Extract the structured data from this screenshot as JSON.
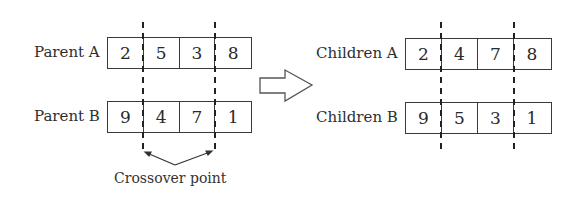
{
  "diagram": {
    "parents": [
      {
        "label": "Parent A",
        "genes": [
          "2",
          "5",
          "3",
          "8"
        ]
      },
      {
        "label": "Parent B",
        "genes": [
          "9",
          "4",
          "7",
          "1"
        ]
      }
    ],
    "children": [
      {
        "label": "Children A",
        "genes": [
          "2",
          "4",
          "7",
          "8"
        ]
      },
      {
        "label": "Children B",
        "genes": [
          "9",
          "5",
          "3",
          "1"
        ]
      }
    ],
    "crossover_label": "Crossover point",
    "arrow": "right-arrow-hollow",
    "colors": {
      "stroke": "#3a3a3a",
      "text": "#2a2a2a",
      "background": "#ffffff"
    }
  }
}
